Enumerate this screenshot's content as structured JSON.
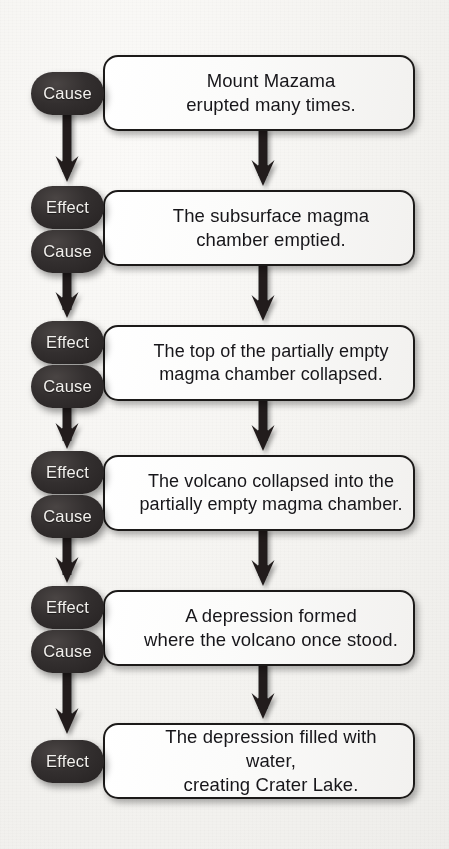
{
  "diagram": {
    "type": "cause-effect-flowchart",
    "colors": {
      "background": "#f4f3f0",
      "box_fill": "#fbfbfa",
      "box_border": "#1c1a19",
      "pill_fill": "#2e2b2b",
      "pill_text": "#f3f1ee",
      "body_text": "#17161a",
      "arrow": "#231f1f"
    },
    "labels": {
      "cause": "Cause",
      "effect": "Effect"
    },
    "steps": [
      {
        "index": 1,
        "text": "Mount Mazama\nerupted many times.",
        "pills": [
          "Cause"
        ]
      },
      {
        "index": 2,
        "text": "The subsurface magma\nchamber emptied.",
        "pills": [
          "Effect",
          "Cause"
        ]
      },
      {
        "index": 3,
        "text": "The top of the partially empty\nmagma chamber collapsed.",
        "pills": [
          "Effect",
          "Cause"
        ]
      },
      {
        "index": 4,
        "text": "The volcano collapsed into the\npartially empty magma chamber.",
        "pills": [
          "Effect",
          "Cause"
        ]
      },
      {
        "index": 5,
        "text": "A depression formed\nwhere the volcano once stood.",
        "pills": [
          "Effect",
          "Cause"
        ]
      },
      {
        "index": 6,
        "text": "The depression filled with water,\ncreating Crater Lake.",
        "pills": [
          "Effect"
        ]
      }
    ]
  }
}
